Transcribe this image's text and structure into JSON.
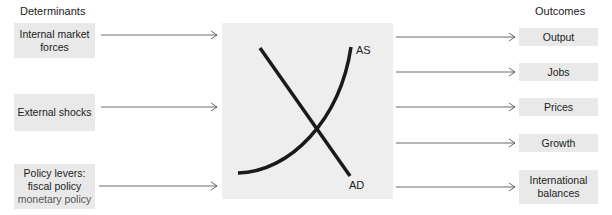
{
  "determinants": {
    "heading": "Determinants",
    "items": [
      {
        "lines": [
          "Internal market",
          "forces"
        ]
      },
      {
        "lines": [
          "External shocks"
        ]
      },
      {
        "lines": [
          "Policy levers:",
          "fiscal policy",
          "monetary policy"
        ]
      }
    ]
  },
  "outcomes": {
    "heading": "Outcomes",
    "items": [
      {
        "lines": [
          "Output"
        ]
      },
      {
        "lines": [
          "Jobs"
        ]
      },
      {
        "lines": [
          "Prices"
        ]
      },
      {
        "lines": [
          "Growth"
        ]
      },
      {
        "lines": [
          "International",
          "balances"
        ]
      }
    ]
  },
  "center_graph": {
    "curves": [
      {
        "label": "AS",
        "shape": "upward convex curve"
      },
      {
        "label": "AD",
        "shape": "downward sloping line"
      }
    ]
  },
  "colors": {
    "box_fill": "#e9e9e9",
    "panel_fill": "#eeeeee",
    "curve": "#1a1a1a",
    "arrow": "#444444"
  }
}
